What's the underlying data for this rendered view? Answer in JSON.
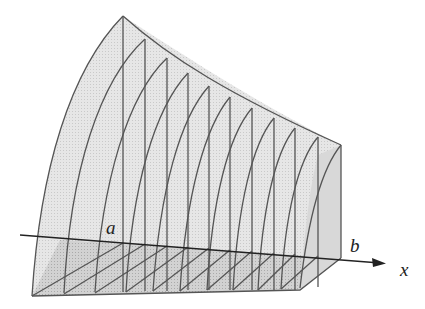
{
  "figure": {
    "labels": {
      "a": "a",
      "b": "b",
      "x_axis": "x"
    },
    "colors": {
      "fill": "#e4e4e4",
      "fill_bottom": "#cfcfcf",
      "stroke": "#555555",
      "axis": "#222222",
      "background": "#ffffff"
    },
    "slices": 11
  }
}
